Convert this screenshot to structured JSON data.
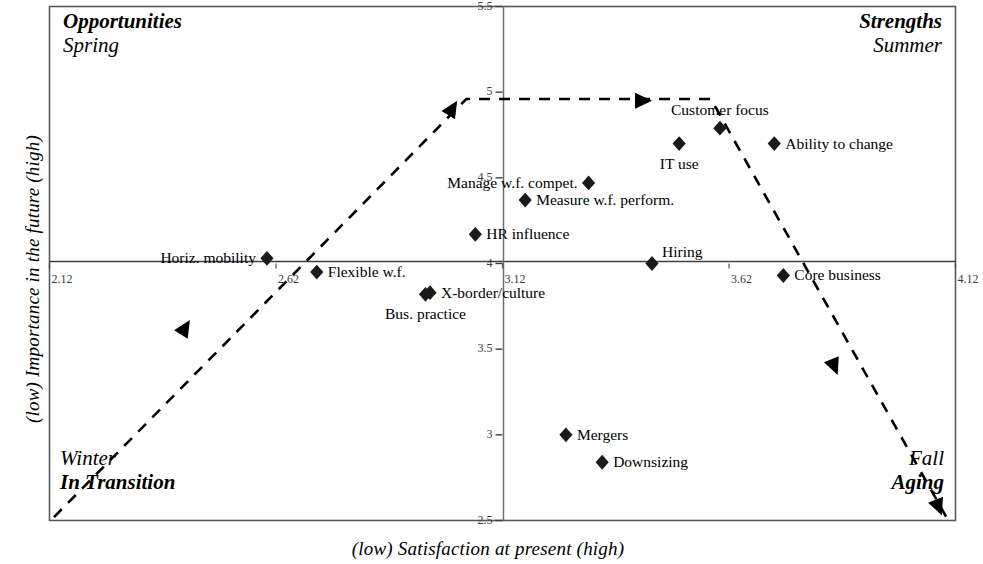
{
  "figure": {
    "x_axis_title": "(low)   Satisfaction at present  (high)",
    "y_axis_title": "(low)   Importance in the future  (high)"
  },
  "quadrants": [
    {
      "id": "opportunities",
      "bold_label": "Opportunities",
      "season_label": "Spring"
    },
    {
      "id": "strengths",
      "bold_label": "Strengths",
      "season_label": "Summer"
    },
    {
      "id": "transition",
      "bold_label": "In Transition",
      "season_label": "Winter"
    },
    {
      "id": "aging",
      "bold_label": "Aging",
      "season_label": "Fall"
    }
  ],
  "chart_data": {
    "type": "scatter",
    "title": "",
    "xlabel": "(low)   Satisfaction at present  (high)",
    "ylabel": "(low)   Importance in the future  (high)",
    "xlim": [
      2.12,
      4.12
    ],
    "ylim": [
      2.5,
      5.5
    ],
    "xticks": [
      "2.12",
      "2.62",
      "3.12",
      "3.62",
      "4.12"
    ],
    "yticks": [
      "5.5",
      "5",
      "4.5",
      "4",
      "3.5",
      "3",
      "2.5"
    ],
    "grid": false,
    "legend": "none",
    "crosshair_x": 3.12,
    "crosshair_y": 4.0,
    "points": [
      {
        "label": "Horiz. mobility",
        "x": 2.6,
        "y": 4.03,
        "label_pos": "left"
      },
      {
        "label": "Flexible w.f.",
        "x": 2.71,
        "y": 3.95,
        "label_pos": "right"
      },
      {
        "label": "X-border/culture",
        "x": 2.96,
        "y": 3.83,
        "label_pos": "right"
      },
      {
        "label": "Bus. practice",
        "x": 2.95,
        "y": 3.82,
        "label_pos": "below"
      },
      {
        "label": "HR influence",
        "x": 3.06,
        "y": 4.17,
        "label_pos": "right"
      },
      {
        "label": "Measure w.f. perform.",
        "x": 3.17,
        "y": 4.37,
        "label_pos": "right"
      },
      {
        "label": "Manage w.f. compet.",
        "x": 3.31,
        "y": 4.47,
        "label_pos": "left"
      },
      {
        "label": "IT use",
        "x": 3.51,
        "y": 4.7,
        "label_pos": "below"
      },
      {
        "label": "Customer focus",
        "x": 3.6,
        "y": 4.79,
        "label_pos": "above"
      },
      {
        "label": "Ability to change",
        "x": 3.72,
        "y": 4.7,
        "label_pos": "right"
      },
      {
        "label": "Hiring",
        "x": 3.45,
        "y": 4.0,
        "label_pos": "above-right"
      },
      {
        "label": "Core business",
        "x": 3.74,
        "y": 3.93,
        "label_pos": "right"
      },
      {
        "label": "Mergers",
        "x": 3.26,
        "y": 3.0,
        "label_pos": "right"
      },
      {
        "label": "Downsizing",
        "x": 3.34,
        "y": 2.84,
        "label_pos": "right"
      }
    ],
    "lifecycle_path": {
      "style": "dashed",
      "vertices": [
        {
          "x": 2.13,
          "y": 2.52
        },
        {
          "x": 3.04,
          "y": 4.96
        },
        {
          "x": 3.58,
          "y": 4.96
        },
        {
          "x": 4.1,
          "y": 2.52
        }
      ],
      "arrow_markers": [
        {
          "x": 2.43,
          "y": 3.67,
          "direction": "up-right"
        },
        {
          "x": 3.02,
          "y": 4.95,
          "direction": "up-right"
        },
        {
          "x": 3.45,
          "y": 4.95,
          "direction": "right"
        },
        {
          "x": 3.86,
          "y": 3.35,
          "direction": "down-right"
        },
        {
          "x": 4.09,
          "y": 2.53,
          "direction": "down-right"
        }
      ]
    }
  },
  "colors": {
    "ink": "#000000",
    "background": "#ffffff",
    "marker": "#1a1a1a",
    "tick_text": "#3a3a3a"
  }
}
